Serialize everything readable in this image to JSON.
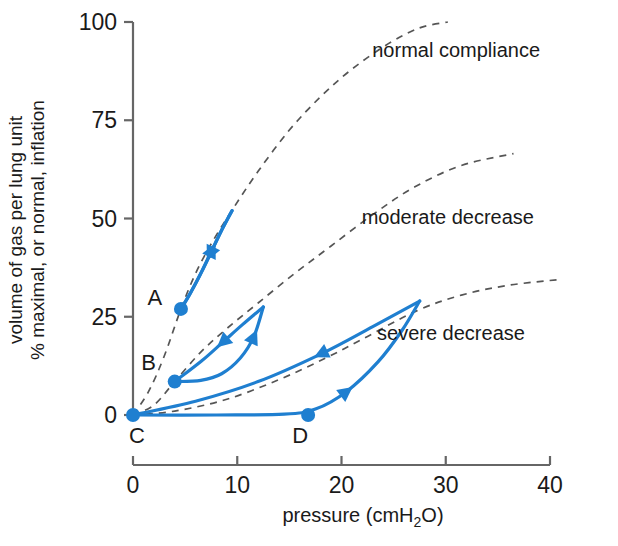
{
  "chart_data": {
    "type": "line",
    "title": "",
    "xlabel": "pressure (cmH2O)",
    "xlabel_main": "pressure",
    "xlabel_unit_pre": "(cmH",
    "xlabel_unit_sub": "2",
    "xlabel_unit_post": "O)",
    "ylabel_line1": "volume of gas per lung unit",
    "ylabel_line2": "% maximal, or normal, inflation",
    "xlim": [
      0,
      40
    ],
    "ylim": [
      0,
      100
    ],
    "xticks": [
      0,
      10,
      20,
      30,
      40
    ],
    "yticks": [
      0,
      25,
      50,
      75,
      100
    ],
    "xtick_labels": [
      "0",
      "10",
      "20",
      "30",
      "40"
    ],
    "ytick_labels": [
      "0",
      "25",
      "50",
      "75",
      "100"
    ],
    "grid": false,
    "legend": "none",
    "accent_color": "#1f7fd0",
    "axis_color": "#666666",
    "dash_color": "#555555",
    "annotations": [
      {
        "id": "normal",
        "text": "normal compliance",
        "x": 31.0,
        "y": 91.0
      },
      {
        "id": "moderate",
        "text": "moderate decrease",
        "x": 30.2,
        "y": 48.5
      },
      {
        "id": "severe",
        "text": "severe decrease",
        "x": 30.5,
        "y": 19.0
      }
    ],
    "series": [
      {
        "name": "normal compliance",
        "style": "dashed",
        "color": "#555555",
        "points": [
          [
            0.0,
            0.0
          ],
          [
            1.5,
            6.0
          ],
          [
            3.0,
            15.0
          ],
          [
            4.6,
            27.0
          ],
          [
            6.0,
            36.0
          ],
          [
            7.6,
            44.0
          ],
          [
            9.6,
            52.5
          ],
          [
            12.0,
            62.0
          ],
          [
            15.0,
            72.5
          ],
          [
            18.0,
            81.0
          ],
          [
            21.0,
            88.0
          ],
          [
            24.5,
            94.5
          ],
          [
            27.5,
            98.5
          ],
          [
            30.2,
            100.0
          ]
        ]
      },
      {
        "name": "moderate decrease",
        "style": "dashed",
        "color": "#555555",
        "points": [
          [
            0.0,
            0.0
          ],
          [
            2.0,
            2.5
          ],
          [
            4.0,
            8.5
          ],
          [
            6.5,
            16.0
          ],
          [
            9.0,
            22.0
          ],
          [
            12.0,
            28.5
          ],
          [
            15.5,
            36.0
          ],
          [
            19.0,
            43.0
          ],
          [
            23.0,
            51.0
          ],
          [
            27.0,
            58.0
          ],
          [
            31.5,
            63.5
          ],
          [
            36.5,
            66.5
          ]
        ]
      },
      {
        "name": "severe decrease",
        "style": "dashed",
        "color": "#555555",
        "points": [
          [
            0.0,
            0.0
          ],
          [
            4.0,
            1.0
          ],
          [
            9.0,
            4.0
          ],
          [
            14.0,
            9.0
          ],
          [
            18.5,
            14.5
          ],
          [
            22.5,
            20.0
          ],
          [
            27.2,
            26.5
          ],
          [
            31.5,
            30.5
          ],
          [
            36.0,
            33.0
          ],
          [
            41.0,
            34.5
          ]
        ]
      },
      {
        "name": "loop A (normal)",
        "style": "solid",
        "color": "#1f7fd0",
        "start_label": "A",
        "start_point": [
          4.6,
          27.0
        ],
        "apex_point": [
          9.5,
          52.0
        ],
        "inflation_points": [
          [
            4.6,
            27.0
          ],
          [
            5.6,
            31.5
          ],
          [
            6.6,
            36.5
          ],
          [
            7.6,
            42.0
          ],
          [
            8.6,
            47.5
          ],
          [
            9.5,
            52.0
          ]
        ],
        "deflation_points": [
          [
            9.5,
            52.0
          ],
          [
            8.4,
            46.5
          ],
          [
            7.4,
            41.0
          ],
          [
            6.4,
            35.5
          ],
          [
            5.4,
            30.5
          ],
          [
            4.6,
            27.0
          ]
        ]
      },
      {
        "name": "loop B (moderate)",
        "style": "solid",
        "color": "#1f7fd0",
        "start_label": "B",
        "start_point": [
          4.0,
          8.5
        ],
        "apex_point": [
          12.5,
          27.5
        ],
        "inflation_points": [
          [
            4.0,
            8.5
          ],
          [
            6.5,
            8.8
          ],
          [
            8.5,
            10.5
          ],
          [
            10.3,
            14.5
          ],
          [
            11.6,
            20.0
          ],
          [
            12.5,
            27.5
          ]
        ],
        "deflation_points": [
          [
            12.5,
            27.5
          ],
          [
            10.5,
            23.0
          ],
          [
            8.6,
            18.5
          ],
          [
            6.6,
            13.8
          ],
          [
            4.0,
            8.5
          ]
        ]
      },
      {
        "name": "loop C-D (severe)",
        "style": "solid",
        "color": "#1f7fd0",
        "start_label": "C",
        "start_point": [
          0.0,
          0.0
        ],
        "mid_label": "D",
        "mid_point": [
          16.8,
          0.0
        ],
        "apex_point": [
          27.5,
          29.0
        ],
        "inflation_points": [
          [
            0.0,
            0.0
          ],
          [
            8.0,
            0.0
          ],
          [
            14.5,
            0.2
          ],
          [
            17.5,
            1.5
          ],
          [
            20.5,
            6.0
          ],
          [
            23.5,
            13.5
          ],
          [
            25.8,
            21.5
          ],
          [
            27.5,
            29.0
          ]
        ],
        "deflation_points": [
          [
            27.5,
            29.0
          ],
          [
            23.0,
            22.5
          ],
          [
            18.0,
            15.5
          ],
          [
            12.0,
            8.5
          ],
          [
            6.0,
            3.5
          ],
          [
            0.0,
            0.0
          ]
        ]
      }
    ],
    "markers": [
      {
        "label": "A",
        "x": 4.6,
        "y": 27.0,
        "label_dx": -26,
        "label_dy": -4
      },
      {
        "label": "B",
        "x": 4.0,
        "y": 8.5,
        "label_dx": -26,
        "label_dy": -12
      },
      {
        "label": "C",
        "x": 0.0,
        "y": 0.0,
        "label_dx": 4,
        "label_dy": 28
      },
      {
        "label": "D",
        "x": 16.8,
        "y": 0.0,
        "label_dx": -8,
        "label_dy": 28
      }
    ],
    "arrows": [
      {
        "series": "loop A (normal)",
        "phase": "inflation",
        "x": 8.0,
        "y": 44.0,
        "dir": "up-right"
      },
      {
        "series": "loop A (normal)",
        "phase": "deflation",
        "x": 7.0,
        "y": 39.0,
        "dir": "down-left"
      },
      {
        "series": "loop B (moderate)",
        "phase": "inflation",
        "x": 11.0,
        "y": 17.5,
        "dir": "up-right"
      },
      {
        "series": "loop B (moderate)",
        "phase": "deflation",
        "x": 8.0,
        "y": 17.5,
        "dir": "down-left"
      },
      {
        "series": "loop C-D (severe)",
        "phase": "inflation",
        "x": 21.5,
        "y": 8.0,
        "dir": "up-right"
      },
      {
        "series": "loop C-D (severe)",
        "phase": "deflation",
        "x": 15.0,
        "y": 12.5,
        "dir": "down-left"
      }
    ]
  }
}
